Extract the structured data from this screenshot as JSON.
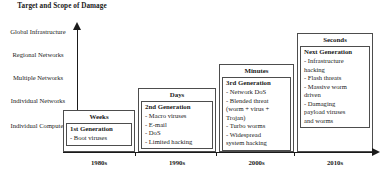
{
  "axis": {
    "y_title": "Target and Scope\nof Damage",
    "y_labels": [
      "Global\nInfrastructure",
      "Regional\nNetworks",
      "Multiple\nNetworks",
      "Individual\nNetworks",
      "Individual\nComputer"
    ],
    "x_labels": [
      "1980s",
      "1990s",
      "2000s",
      "2010s"
    ]
  },
  "generations": [
    {
      "time": "Weeks",
      "title": "1st Generation",
      "items": [
        "- Boot viruses"
      ],
      "decade": "1980s"
    },
    {
      "time": "Days",
      "title": "2nd Generation",
      "items": [
        "- Macro viruses",
        "- E-mail",
        "- DoS",
        "- Limited hacking"
      ],
      "decade": "1990s"
    },
    {
      "time": "Minutes",
      "title": "3rd Generation",
      "items": [
        "- Network DoS",
        "- Blended threat\n(worm + virus +\nTrojan)",
        "- Turbo worms",
        "- Widespread\nsystem hacking"
      ],
      "decade": "2000s"
    },
    {
      "time": "Seconds",
      "title": "Next Generation",
      "items": [
        "- Infrastructure\nhacking",
        "- Flash threats",
        "- Massive worm\ndriven",
        "- Damaging\npayload viruses\nand worms"
      ],
      "decade": "2010s"
    }
  ],
  "colors": {
    "ink": "#1a1a1a",
    "border": "#4d4d4d",
    "background": "#ffffff"
  }
}
